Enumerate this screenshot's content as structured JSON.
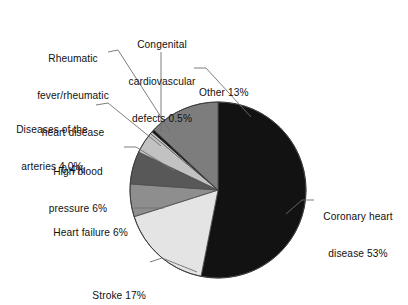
{
  "chart_data": {
    "type": "pie",
    "title": "",
    "subtitle": "",
    "xlabel": "",
    "ylabel": "",
    "legend_position": "callout-labels",
    "grid": false,
    "units": "percent",
    "total": 100,
    "categories": [
      "Coronary heart disease",
      "Stroke",
      "Heart failure",
      "High blood pressure",
      "Diseases of the arteries",
      "Rheumatic fever/rheumatic heart disease",
      "Congenital cardiovascular defects",
      "Other"
    ],
    "values": [
      53,
      17,
      6,
      6,
      4.0,
      0.4,
      0.5,
      13
    ],
    "slices": [
      {
        "id": "other",
        "label": "Other 13%",
        "name": "Other",
        "value": 13,
        "value_text": "13%",
        "color": "#7d7d7d",
        "start_angle": 0,
        "end_angle": 46.8
      },
      {
        "id": "congenital",
        "label": "Congenital cardiovascular defects 0.5%",
        "name": "Congenital cardiovascular defects",
        "value": 0.5,
        "value_text": "0.5%",
        "color": "#171717",
        "start_angle": 46.8,
        "end_angle": 48.6
      },
      {
        "id": "rheumatic",
        "label": "Rheumatic fever/rheumatic heart disease 0.4%",
        "name": "Rheumatic fever/rheumatic heart disease",
        "value": 0.4,
        "value_text": "0.4%",
        "color": "#d2d2d2",
        "start_angle": 48.6,
        "end_angle": 50.04
      },
      {
        "id": "arteries",
        "label": "Diseases of the arteries 4.0%",
        "name": "Diseases of the arteries",
        "value": 4.0,
        "value_text": "4.0%",
        "color": "#c2c2c2",
        "start_angle": 50.04,
        "end_angle": 64.44
      },
      {
        "id": "high-blood-pressure",
        "label": "High blood pressure 6%",
        "name": "High blood pressure",
        "value": 6,
        "value_text": "6%",
        "color": "#585858",
        "start_angle": 64.44,
        "end_angle": 86.04
      },
      {
        "id": "heart-failure",
        "label": "Heart failure 6%",
        "name": "Heart failure",
        "value": 6,
        "value_text": "6%",
        "color": "#8e8e8e",
        "start_angle": 86.04,
        "end_angle": 107.64
      },
      {
        "id": "stroke",
        "label": "Stroke 17%",
        "name": "Stroke",
        "value": 17,
        "value_text": "17%",
        "color": "#e4e4e4",
        "start_angle": 107.64,
        "end_angle": 168.84
      },
      {
        "id": "coronary",
        "label": "Coronary heart disease 53%",
        "name": "Coronary heart disease",
        "value": 53,
        "value_text": "53%",
        "color": "#121212",
        "start_angle": 168.84,
        "end_angle": 360
      }
    ]
  },
  "labels": {
    "rheumatic": {
      "line1": "Rheumatic",
      "line2": "fever/rheumatic",
      "line3": "heart disease",
      "line4": "0.4%"
    },
    "congenital": {
      "line1": "Congenital",
      "line2": "cardiovascular",
      "line3": "defects 0.5%"
    },
    "other": {
      "line1": "Other 13%"
    },
    "arteries": {
      "line1": "Diseases of the",
      "line2": "arteries 4.0%"
    },
    "high_blood_pressure": {
      "line1": "High blood",
      "line2": "pressure 6%"
    },
    "heart_failure": {
      "line1": "Heart failure 6%"
    },
    "stroke": {
      "line1": "Stroke 17%"
    },
    "coronary": {
      "line1": "Coronary heart",
      "line2": "disease 53%"
    }
  },
  "colors": {
    "background": "#ffffff",
    "text": "#111111",
    "leader_line": "#6f6f6f",
    "slice_outline": "#4a4a4a"
  }
}
